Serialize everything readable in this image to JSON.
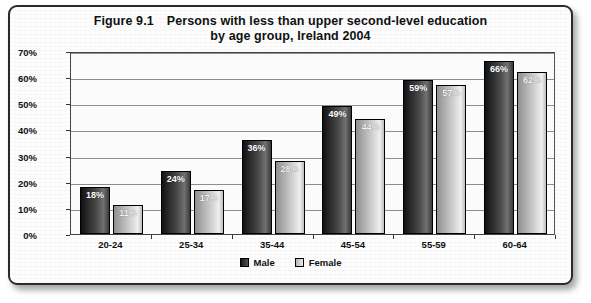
{
  "title": {
    "figure_number": "Figure 9.1",
    "line1": "Persons with less than upper second-level education",
    "line2": "by age group, Ireland 2004"
  },
  "legend": {
    "male_label": "Male",
    "female_label": "Female"
  },
  "axis": {
    "yticks": [
      "70%",
      "60%",
      "50%",
      "40%",
      "30%",
      "20%",
      "10%",
      "0%"
    ]
  },
  "bar_labels": {
    "male": [
      "18%",
      "24%",
      "36%",
      "49%",
      "59%",
      "66%"
    ],
    "female": [
      "11%",
      "17%",
      "28%",
      "44%",
      "57%",
      "62%"
    ]
  },
  "chart_data": {
    "type": "bar",
    "xlabel": "",
    "ylabel": "",
    "ylim": [
      0,
      70
    ],
    "ytick_values": [
      0,
      10,
      20,
      30,
      40,
      50,
      60,
      70
    ],
    "ytick_labels": [
      "0%",
      "10%",
      "20%",
      "30%",
      "40%",
      "50%",
      "60%",
      "70%"
    ],
    "grid": true,
    "legend_position": "bottom",
    "categories": [
      "20-24",
      "25-34",
      "35-44",
      "45-54",
      "55-59",
      "60-64"
    ],
    "series": [
      {
        "name": "Male",
        "values": [
          18,
          24,
          36,
          49,
          59,
          66
        ],
        "color": "#2a2a2a"
      },
      {
        "name": "Female",
        "values": [
          11,
          17,
          28,
          44,
          57,
          62
        ],
        "color": "#cccccc"
      }
    ],
    "units": "percent"
  }
}
